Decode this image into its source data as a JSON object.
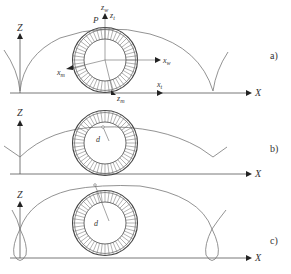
{
  "figure": {
    "panels": [
      {
        "id": "a",
        "label": "a)",
        "axis_z": "Z",
        "axis_x": "X",
        "curve_type": "cycloid-cusp",
        "labels": {
          "point_p": "P",
          "z_w": "z",
          "z_w_sub": "w",
          "z_t": "z",
          "z_t_sub": "t",
          "x_w": "x",
          "x_w_sub": "w",
          "x_m": "x",
          "x_m_sub": "m",
          "z_m": "z",
          "z_m_sub": "m",
          "x_t": "x",
          "x_t_sub": "t"
        }
      },
      {
        "id": "b",
        "label": "b)",
        "axis_z": "Z",
        "axis_x": "X",
        "curve_type": "curtate",
        "labels": {
          "d": "d"
        }
      },
      {
        "id": "c",
        "label": "c)",
        "axis_z": "Z",
        "axis_x": "X",
        "curve_type": "prolate-loop",
        "labels": {
          "d": "d"
        }
      }
    ]
  }
}
